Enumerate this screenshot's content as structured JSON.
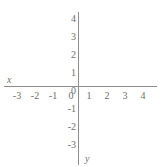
{
  "figure": {
    "background_color": "#ffffff",
    "axis_color": "#8d8d8d",
    "label_color": "#6e6e6e",
    "width": 162,
    "height": 167
  },
  "axis_names": {
    "x": "x",
    "y": "y"
  },
  "chart_data": {
    "type": "scatter",
    "title": "",
    "subtitle": "",
    "xlabel": "x",
    "ylabel": "y",
    "xlim": [
      -3.8,
      4.4
    ],
    "ylim": [
      -3.5,
      4.4
    ],
    "xticks": [
      -3,
      -2,
      -1,
      0,
      1,
      2,
      3,
      4
    ],
    "yticks": [
      4,
      3,
      2,
      1,
      0,
      -1,
      -2,
      -3
    ],
    "xtick_labels": [
      "-3",
      "-2",
      "-1",
      "0",
      "1",
      "2",
      "3",
      "4"
    ],
    "ytick_labels": [
      "4",
      "3",
      "2",
      "1",
      "0",
      "-1",
      "-2",
      "-3"
    ],
    "x_tick_positions_px": [
      17,
      35,
      53,
      71,
      89,
      107,
      125,
      143
    ],
    "y_tick_positions_px": [
      19,
      37,
      55,
      73,
      91,
      109,
      127,
      145
    ],
    "series": [],
    "x": [],
    "values": [],
    "grid": false,
    "legend": false,
    "legend_position": "none",
    "annotations": []
  }
}
